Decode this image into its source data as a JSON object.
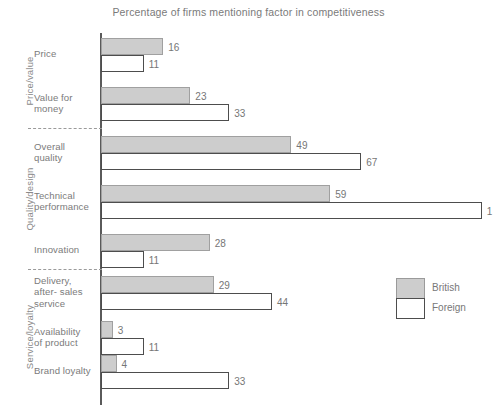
{
  "chart_data": {
    "type": "bar",
    "orientation": "horizontal",
    "title": "Percentage of firms mentioning factor in competitiveness",
    "xlabel": "",
    "ylabel": "",
    "xlim": [
      0,
      100
    ],
    "grid": false,
    "legend_position": "right",
    "categories": [
      "Price",
      "Value for money",
      "Overall quality",
      "Technical performance",
      "Innovation",
      "Delivery, after-sales service",
      "Availability of product",
      "Brand loyalty"
    ],
    "series": [
      {
        "name": "British",
        "color": "#cdcdcd",
        "values": [
          16,
          23,
          49,
          59,
          28,
          29,
          3,
          4
        ]
      },
      {
        "name": "Foreign",
        "color": "#ffffff",
        "values": [
          11,
          33,
          67,
          98,
          11,
          44,
          11,
          33
        ]
      }
    ],
    "groups": [
      {
        "label": "Price/value",
        "categories": [
          "Price",
          "Value for money"
        ]
      },
      {
        "label": "Quality/design",
        "categories": [
          "Overall quality",
          "Technical performance",
          "Innovation"
        ]
      },
      {
        "label": "Service/loyalty",
        "categories": [
          "Delivery, after-sales service",
          "Availability of product",
          "Brand loyalty"
        ]
      }
    ]
  },
  "title": "Percentage of firms mentioning factor in competitiveness",
  "groups": [
    {
      "label": "Price/value"
    },
    {
      "label": "Quality/design"
    },
    {
      "label": "Service/loyalty"
    }
  ],
  "rows": [
    {
      "lines": [
        "Price"
      ],
      "british": {
        "value": 16,
        "label": "16"
      },
      "foreign": {
        "value": 11,
        "label": "11"
      }
    },
    {
      "lines": [
        "Value for",
        "money"
      ],
      "british": {
        "value": 23,
        "label": "23"
      },
      "foreign": {
        "value": 33,
        "label": "33"
      }
    },
    {
      "lines": [
        "Overall",
        "quality"
      ],
      "british": {
        "value": 49,
        "label": "49"
      },
      "foreign": {
        "value": 67,
        "label": "67"
      }
    },
    {
      "lines": [
        "Technical",
        "performance"
      ],
      "british": {
        "value": 59,
        "label": "59"
      },
      "foreign": {
        "value": 98,
        "label": "1"
      }
    },
    {
      "lines": [
        "Innovation"
      ],
      "british": {
        "value": 28,
        "label": "28"
      },
      "foreign": {
        "value": 11,
        "label": "11"
      }
    },
    {
      "lines": [
        "Delivery,",
        "after- sales",
        "service"
      ],
      "british": {
        "value": 29,
        "label": "29"
      },
      "foreign": {
        "value": 44,
        "label": "44"
      }
    },
    {
      "lines": [
        "Availability",
        "of product"
      ],
      "british": {
        "value": 3,
        "label": "3"
      },
      "foreign": {
        "value": 11,
        "label": "11"
      }
    },
    {
      "lines": [
        "Brand loyalty"
      ],
      "british": {
        "value": 4,
        "label": "4"
      },
      "foreign": {
        "value": 33,
        "label": "33"
      }
    }
  ],
  "legend": {
    "british_label": "British",
    "foreign_label": "Foreign"
  }
}
